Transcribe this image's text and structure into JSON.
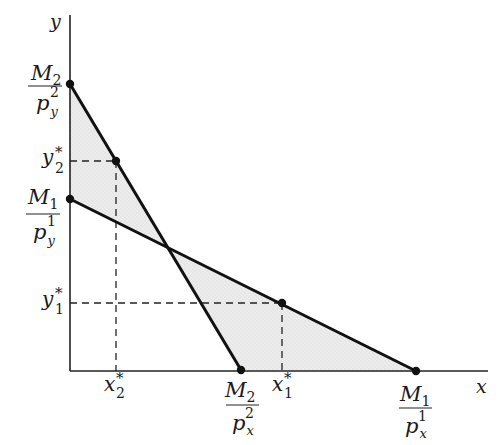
{
  "diagram": {
    "type": "budget-line diagram (revealed preference)",
    "axes": {
      "x_label": "x",
      "y_label": "y"
    },
    "budget_lines": [
      {
        "name": "budget-line-1",
        "x_intercept": {
          "num": "M",
          "num_sub": "1",
          "den": "p",
          "den_sub": "x",
          "den_sup": "1"
        },
        "y_intercept": {
          "num": "M",
          "num_sub": "1",
          "den": "p",
          "den_sub": "y",
          "den_sup": "1"
        }
      },
      {
        "name": "budget-line-2",
        "x_intercept": {
          "num": "M",
          "num_sub": "2",
          "den": "p",
          "den_sub": "x",
          "den_sup": "2"
        },
        "y_intercept": {
          "num": "M",
          "num_sub": "2",
          "den": "p",
          "den_sub": "y",
          "den_sup": "2"
        }
      }
    ],
    "chosen_points": [
      {
        "name": "bundle-1",
        "x_label": "x",
        "x_sub": "1",
        "y_label": "y",
        "y_sub": "1",
        "star": "*"
      },
      {
        "name": "bundle-2",
        "x_label": "x",
        "x_sub": "2",
        "y_label": "y",
        "y_sub": "2",
        "star": "*"
      }
    ],
    "colors": {
      "line": "#111111",
      "shade": "#e6e6e6",
      "background": "#ffffff"
    }
  }
}
